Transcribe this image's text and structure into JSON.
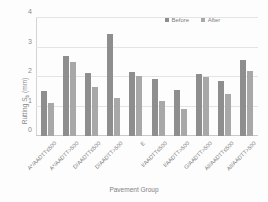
{
  "chart_data": {
    "type": "bar",
    "title": "",
    "xlabel": "Pavement Group",
    "ylabel": "Rutting Sᵇ (mm)",
    "ylabel_main": "Rutting S",
    "ylabel_sub": "b",
    "ylabel_unit": " (mm)",
    "ylim": [
      0,
      4
    ],
    "yticks": [
      0,
      1,
      2,
      3,
      4
    ],
    "ytick_labels": [
      "0",
      "1",
      "2",
      "3",
      "4"
    ],
    "grid": true,
    "legend_position": "top-right",
    "categories": [
      "A*/AADTT≤500",
      "A*/AADTT>500",
      "D/AADTT≤500",
      "D/AADTT>500",
      "E",
      "I/AADTT≤500",
      "I/AADTT>500",
      "G/AADTT>500",
      "All/AADTT≤500",
      "All/AADTT>500"
    ],
    "series": [
      {
        "name": "Before",
        "color": "#8e8e8e",
        "values": [
          1.52,
          2.7,
          2.15,
          3.45,
          2.17,
          1.92,
          1.57,
          2.1,
          1.85,
          2.58
        ]
      },
      {
        "name": "After",
        "color": "#a8a8a8",
        "values": [
          1.12,
          2.51,
          1.67,
          1.28,
          2.02,
          1.18,
          0.91,
          1.99,
          1.43,
          2.19
        ]
      }
    ]
  },
  "legend": {
    "items": [
      {
        "label": "Before",
        "key": "before"
      },
      {
        "label": "After",
        "key": "after"
      }
    ]
  }
}
